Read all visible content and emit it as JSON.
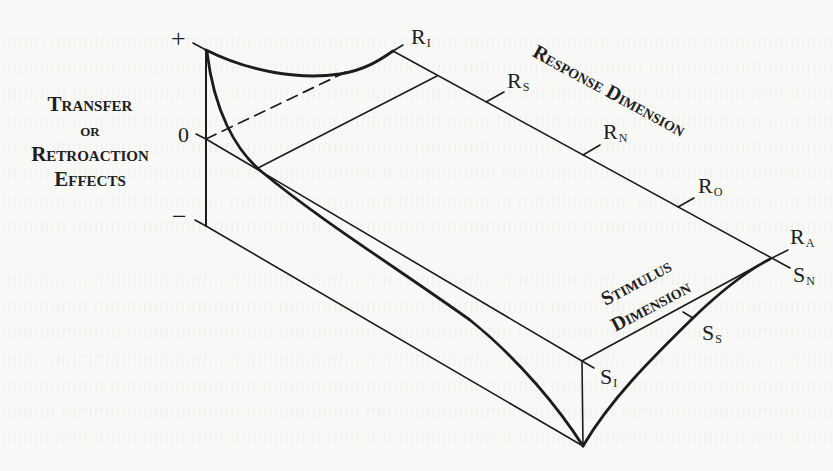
{
  "figure": {
    "side_label": {
      "lines": [
        "Transfer",
        "or",
        "Retroaction",
        "Effects"
      ]
    },
    "vertical_axis": {
      "plus": "+",
      "zero": "0",
      "minus": "−"
    },
    "response_axis": {
      "title": "Response Dimension",
      "ticks": [
        {
          "main": "R",
          "sub": "I"
        },
        {
          "main": "R",
          "sub": "S"
        },
        {
          "main": "R",
          "sub": "N"
        },
        {
          "main": "R",
          "sub": "O"
        },
        {
          "main": "R",
          "sub": "A"
        }
      ]
    },
    "stimulus_axis": {
      "title_line1": "Stimulus",
      "title_line2": "Dimension",
      "ticks": [
        {
          "main": "S",
          "sub": "N"
        },
        {
          "main": "S",
          "sub": "S"
        },
        {
          "main": "S",
          "sub": "I"
        }
      ]
    }
  },
  "colors": {
    "ink": "#1a1a1a",
    "paper": "#f8f8f7"
  }
}
